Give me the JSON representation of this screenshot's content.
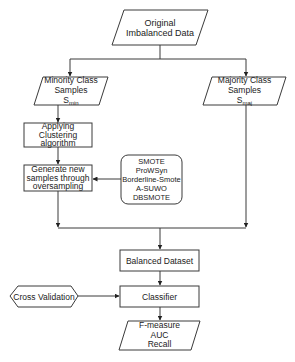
{
  "diagram": {
    "type": "flowchart",
    "colors": {
      "stroke": "#3a3a3a",
      "text": "#222222",
      "background": "#ffffff"
    },
    "nodes": {
      "original": {
        "shape": "parallelogram",
        "lines": [
          "Original",
          "Imbalanced Data"
        ]
      },
      "minority": {
        "shape": "parallelogram",
        "lines": [
          "Minority Class",
          "Samples"
        ],
        "symbol": "S",
        "symbol_sub": "min"
      },
      "majority": {
        "shape": "parallelogram",
        "lines": [
          "Majority Class",
          "Samples"
        ],
        "symbol": "S",
        "symbol_sub": "maj"
      },
      "clustering": {
        "shape": "rectangle",
        "lines": [
          "Applying",
          "Clustering",
          "algorithm"
        ]
      },
      "generate": {
        "shape": "rectangle",
        "lines": [
          "Generate new",
          "samples through",
          "oversampling"
        ]
      },
      "methods": {
        "shape": "rounded-rectangle",
        "lines": [
          "SMOTE",
          "ProWSyn",
          "Borderline-Smote",
          "A-SUWO",
          "DBSMOTE"
        ]
      },
      "balanced": {
        "shape": "rectangle",
        "label": "Balanced Dataset"
      },
      "cross_validation": {
        "shape": "hexagon",
        "label": "Cross Validation"
      },
      "classifier": {
        "shape": "rectangle",
        "label": "Classifier"
      },
      "metrics": {
        "shape": "parallelogram",
        "lines": [
          "F-measure",
          "AUC",
          "Recall"
        ]
      }
    },
    "edges": [
      {
        "from": "original",
        "to": "minority"
      },
      {
        "from": "original",
        "to": "majority"
      },
      {
        "from": "minority",
        "to": "clustering"
      },
      {
        "from": "clustering",
        "to": "generate"
      },
      {
        "from": "methods",
        "to": "generate"
      },
      {
        "from": "generate",
        "to": "balanced"
      },
      {
        "from": "majority",
        "to": "balanced"
      },
      {
        "from": "balanced",
        "to": "classifier"
      },
      {
        "from": "cross_validation",
        "to": "classifier"
      },
      {
        "from": "classifier",
        "to": "metrics"
      }
    ]
  }
}
